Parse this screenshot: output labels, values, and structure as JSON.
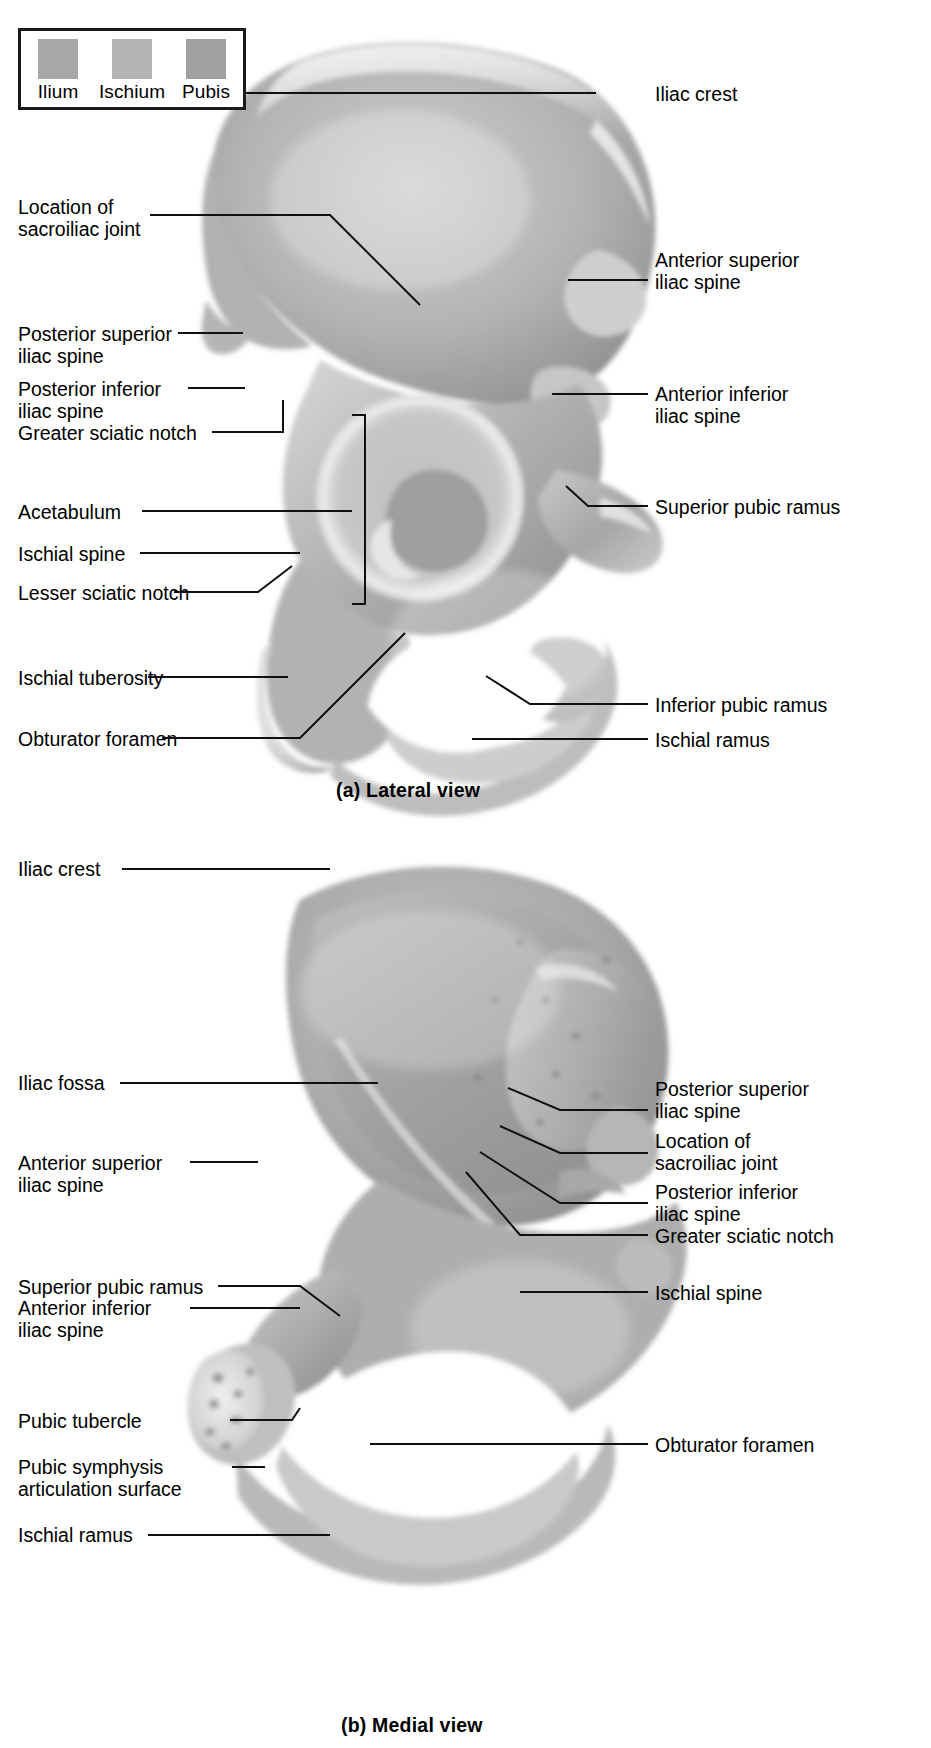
{
  "figure": {
    "legend": {
      "items": [
        {
          "name": "Ilium",
          "color": "#a8a8a8"
        },
        {
          "name": "Ischium",
          "color": "#b4b4b4"
        },
        {
          "name": "Pubis",
          "color": "#a0a0a0"
        }
      ]
    },
    "panels": [
      {
        "id": "a",
        "caption": "(a) Lateral view",
        "labels_left": [
          {
            "text": "Location of\nsacroiliac joint"
          },
          {
            "text": "Posterior superior\niliac spine"
          },
          {
            "text": "Posterior inferior\niliac spine"
          },
          {
            "text": "Greater sciatic notch"
          },
          {
            "text": "Acetabulum"
          },
          {
            "text": "Ischial spine"
          },
          {
            "text": "Lesser sciatic notch"
          },
          {
            "text": "Ischial tuberosity"
          },
          {
            "text": "Obturator foramen"
          }
        ],
        "labels_right": [
          {
            "text": "Iliac crest"
          },
          {
            "text": "Anterior superior\niliac spine"
          },
          {
            "text": "Anterior inferior\niliac spine"
          },
          {
            "text": "Superior pubic ramus"
          },
          {
            "text": "Inferior pubic ramus"
          },
          {
            "text": "Ischial ramus"
          }
        ]
      },
      {
        "id": "b",
        "caption": "(b) Medial view",
        "labels_left": [
          {
            "text": "Iliac crest"
          },
          {
            "text": "Iliac fossa"
          },
          {
            "text": "Anterior superior\niliac spine"
          },
          {
            "text": "Anterior inferior\niliac spine"
          },
          {
            "text": "Superior pubic ramus"
          },
          {
            "text": "Pubic tubercle"
          },
          {
            "text": "Pubic symphysis\narticulation surface"
          },
          {
            "text": "Ischial ramus"
          }
        ],
        "labels_right": [
          {
            "text": "Posterior superior\niliac spine"
          },
          {
            "text": "Location of\nsacroiliac joint"
          },
          {
            "text": "Posterior inferior\niliac spine"
          },
          {
            "text": "Greater sciatic notch"
          },
          {
            "text": "Ischial spine"
          },
          {
            "text": "Obturator foramen"
          }
        ]
      }
    ]
  }
}
